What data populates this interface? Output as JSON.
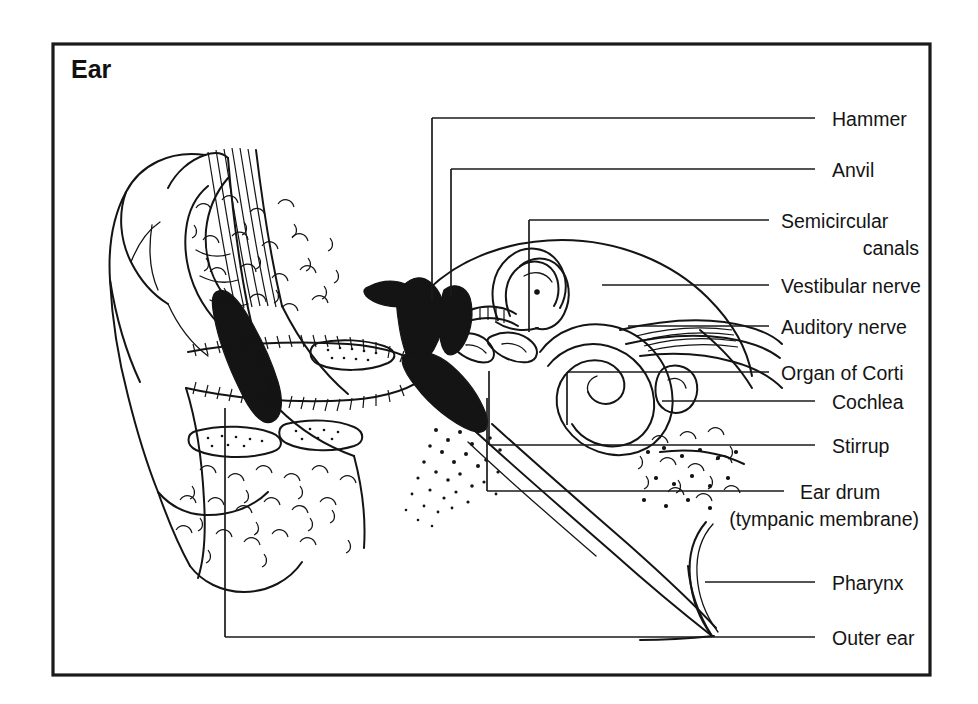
{
  "figure": {
    "title": "Ear",
    "frame": {
      "x": 53,
      "y": 44,
      "width": 877,
      "height": 631
    }
  },
  "labels": [
    {
      "id": "hammer",
      "text": "Hammer",
      "text_x": 832,
      "text_y": 124,
      "line": "M 432,118 L 815,118"
    },
    {
      "id": "anvil",
      "text": "Anvil",
      "text_x": 832,
      "text_y": 175,
      "line": "M 451,169 L 815,169"
    },
    {
      "id": "semicircular",
      "text": "Semicircular",
      "text_x": 781,
      "text_y": 226,
      "line": "M 529,220 L 769,220",
      "line2": "canals",
      "line2_x": 919,
      "line2_y": 252,
      "line2_align": "end"
    },
    {
      "id": "vestibular",
      "text": "Vestibular  nerve",
      "text_x": 781,
      "text_y": 291,
      "line": "M 602,285 L 769,285"
    },
    {
      "id": "auditory",
      "text": "Auditory nerve",
      "text_x": 781,
      "text_y": 331,
      "line": "M 628,326 L 769,326"
    },
    {
      "id": "organ-corti",
      "text": "Organ  of Corti",
      "text_x": 781,
      "text_y": 368,
      "line": "M 567,372 L 769,372"
    },
    {
      "id": "cochlea",
      "text": "Cochlea",
      "text_x": 832,
      "text_y": 407,
      "line": "M 662,401 L 815,401"
    },
    {
      "id": "stirrup",
      "text": "Stirrup",
      "text_x": 832,
      "text_y": 451,
      "line": "M 489,445 L 815,445"
    },
    {
      "id": "ear-drum",
      "text": "Ear drum",
      "text_x": 800,
      "text_y": 497,
      "line": "M 487,491 L 784,491",
      "line2": "(tympanic membrane)",
      "line2_x": 919,
      "line2_y": 522,
      "line2_align": "end"
    },
    {
      "id": "pharynx",
      "text": "Pharynx",
      "text_x": 832,
      "text_y": 588,
      "line": "M 705,582 L 815,582"
    },
    {
      "id": "outer-ear",
      "text": "Outer ear",
      "text_x": 832,
      "text_y": 643,
      "line": "M 225,637 L 815,637"
    }
  ],
  "leader_verticals": [
    {
      "id": "hammer-drop",
      "path": "M 432,118 L 432,300"
    },
    {
      "id": "anvil-drop",
      "path": "M 451,169 L 451,296"
    },
    {
      "id": "semicirc-drop",
      "path": "M 529,220 L 529,332"
    },
    {
      "id": "cochlea-drop",
      "path": "M 662,401 L 662,378"
    },
    {
      "id": "organ-drop",
      "path": "M 567,372 L 567,425"
    },
    {
      "id": "stirrup-drop",
      "path": "M 489,445 L 489,371"
    },
    {
      "id": "eardrum-drop",
      "path": "M 487,491 L 487,398"
    },
    {
      "id": "outerear-drop",
      "path": "M 225,637 L 225,408"
    }
  ],
  "anatomy": {
    "caption": "Cross-section of the human ear showing the pinna, ear canal, ear drum, ossicles, cochlea, semicircular canals, auditory nerve and eustachian tube leading to the pharynx.",
    "parts": [
      "pinna",
      "ear-canal",
      "ear-drum",
      "hammer",
      "anvil",
      "stirrup",
      "semicircular-canals",
      "vestibular-nerve",
      "auditory-nerve",
      "organ-of-corti",
      "cochlea",
      "eustachian-tube",
      "pharynx",
      "bone-tissue"
    ]
  }
}
